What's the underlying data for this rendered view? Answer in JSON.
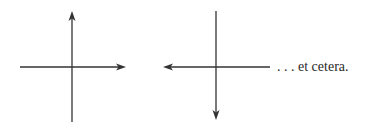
{
  "diagram": {
    "stroke_color": "#333333",
    "figures": [
      {
        "name": "axes-1",
        "horizontal_arrow": "right",
        "vertical_arrow": "up"
      },
      {
        "name": "axes-2",
        "horizontal_arrow": "left",
        "vertical_arrow": "down"
      }
    ],
    "caption": ". . . et cetera."
  }
}
